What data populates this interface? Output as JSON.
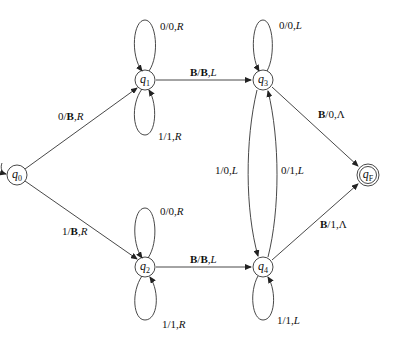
{
  "diagram": {
    "type": "turing-machine-state-diagram",
    "states": [
      {
        "id": "q0",
        "name": "q",
        "sub": "0",
        "x": 17,
        "y": 175,
        "initial": true,
        "final": false
      },
      {
        "id": "q1",
        "name": "q",
        "sub": "1",
        "x": 145,
        "y": 80,
        "initial": false,
        "final": false
      },
      {
        "id": "q2",
        "name": "q",
        "sub": "2",
        "x": 145,
        "y": 267,
        "initial": false,
        "final": false
      },
      {
        "id": "q3",
        "name": "q",
        "sub": "3",
        "x": 263,
        "y": 80,
        "initial": false,
        "final": false
      },
      {
        "id": "q4",
        "name": "q",
        "sub": "4",
        "x": 263,
        "y": 267,
        "initial": false,
        "final": false
      },
      {
        "id": "qF",
        "name": "q",
        "sub": "F",
        "x": 368,
        "y": 175,
        "initial": false,
        "final": true
      }
    ],
    "transitions": [
      {
        "from": "q0",
        "to": "q1",
        "read": "0",
        "write": "B",
        "move": "R",
        "label": "0/B,R"
      },
      {
        "from": "q0",
        "to": "q2",
        "read": "1",
        "write": "B",
        "move": "R",
        "label": "1/B,R"
      },
      {
        "from": "q1",
        "to": "q1",
        "read": "0",
        "write": "0",
        "move": "R",
        "label": "0/0,R"
      },
      {
        "from": "q1",
        "to": "q1",
        "read": "1",
        "write": "1",
        "move": "R",
        "label": "1/1,R"
      },
      {
        "from": "q2",
        "to": "q2",
        "read": "0",
        "write": "0",
        "move": "R",
        "label": "0/0,R"
      },
      {
        "from": "q2",
        "to": "q2",
        "read": "1",
        "write": "1",
        "move": "R",
        "label": "1/1,R"
      },
      {
        "from": "q1",
        "to": "q3",
        "read": "B",
        "write": "B",
        "move": "L",
        "label": "B/B,L"
      },
      {
        "from": "q2",
        "to": "q4",
        "read": "B",
        "write": "B",
        "move": "L",
        "label": "B/B,L"
      },
      {
        "from": "q3",
        "to": "q3",
        "read": "0",
        "write": "0",
        "move": "L",
        "label": "0/0,L"
      },
      {
        "from": "q4",
        "to": "q4",
        "read": "1",
        "write": "1",
        "move": "L",
        "label": "1/1,L"
      },
      {
        "from": "q3",
        "to": "q4",
        "read": "1",
        "write": "0",
        "move": "L",
        "label": "1/0,L"
      },
      {
        "from": "q4",
        "to": "q3",
        "read": "0",
        "write": "1",
        "move": "L",
        "label": "0/1,L"
      },
      {
        "from": "q3",
        "to": "qF",
        "read": "B",
        "write": "0",
        "move": "Λ",
        "label": "B/0,Λ"
      },
      {
        "from": "q4",
        "to": "qF",
        "read": "B",
        "write": "1",
        "move": "Λ",
        "label": "B/1,Λ"
      }
    ]
  },
  "labels": {
    "q0": {
      "name": "q",
      "sub": "0"
    },
    "q1": {
      "name": "q",
      "sub": "1"
    },
    "q2": {
      "name": "q",
      "sub": "2"
    },
    "q3": {
      "name": "q",
      "sub": "3"
    },
    "q4": {
      "name": "q",
      "sub": "4"
    },
    "qF": {
      "name": "q",
      "sub": "F"
    },
    "t_q0_q1": {
      "r": "0/",
      "w": "B",
      "m": ",R"
    },
    "t_q0_q2": {
      "r": "1/",
      "w": "B",
      "m": ",R"
    },
    "t_q1_loop0": {
      "r": "0/0,",
      "m": "R"
    },
    "t_q1_loop1": {
      "r": "1/1,",
      "m": "R"
    },
    "t_q2_loop0": {
      "r": "0/0,",
      "m": "R"
    },
    "t_q2_loop1": {
      "r": "1/1,",
      "m": "R"
    },
    "t_q1_q3": {
      "r": "B",
      "s": "/",
      "w": "B",
      "m": ",L"
    },
    "t_q2_q4": {
      "r": "B",
      "s": "/",
      "w": "B",
      "m": ",L"
    },
    "t_q3_loop": {
      "r": "0/0,",
      "m": "L"
    },
    "t_q4_loop": {
      "r": "1/1,",
      "m": "L"
    },
    "t_q3_q4": {
      "r": "1/0,",
      "m": "L"
    },
    "t_q4_q3": {
      "r": "0/1,",
      "m": "L"
    },
    "t_q3_qF": {
      "r": "B",
      "w": "/0,Λ"
    },
    "t_q4_qF": {
      "r": "B",
      "w": "/1,Λ"
    }
  }
}
